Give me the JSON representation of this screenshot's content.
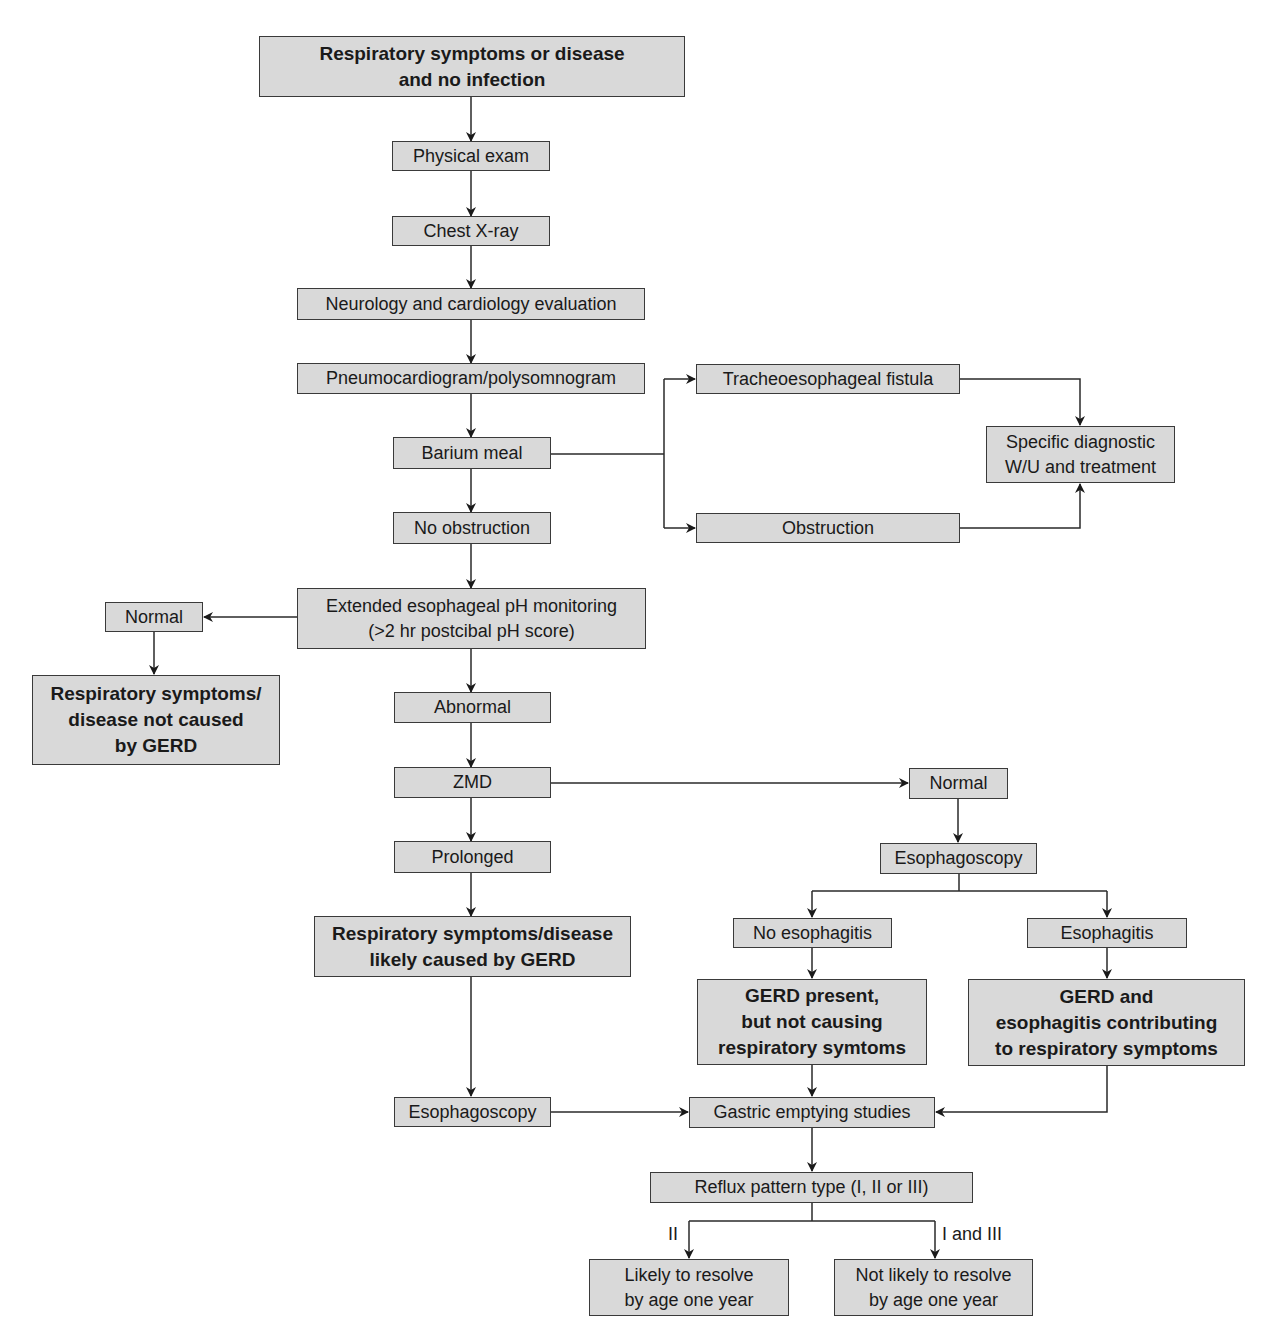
{
  "nodes": {
    "start": "Respiratory symptoms or disease\nand no infection",
    "physical_exam": "Physical exam",
    "chest_xray": "Chest X-ray",
    "neuro_cardio": "Neurology and cardiology evaluation",
    "pneumo": "Pneumocardiogram/polysomnogram",
    "barium": "Barium meal",
    "tef": "Tracheoesophageal fistula",
    "obstruction": "Obstruction",
    "specific_wu": "Specific diagnostic\nW/U and treatment",
    "no_obstruction": "No obstruction",
    "ph_monitoring": "Extended esophageal pH monitoring\n(>2 hr postcibal pH score)",
    "normal_left": "Normal",
    "not_caused": "Respiratory symptoms/\ndisease not caused\nby GERD",
    "abnormal": "Abnormal",
    "zmd": "ZMD",
    "normal_right": "Normal",
    "prolonged": "Prolonged",
    "esophagoscopy_right": "Esophagoscopy",
    "likely_caused": "Respiratory symptoms/disease\nlikely caused by GERD",
    "no_esophagitis": "No esophagitis",
    "esophagitis": "Esophagitis",
    "gerd_present": "GERD present,\nbut not causing\nrespiratory symtoms",
    "gerd_esophagitis": "GERD and\nesophagitis contributing\nto respiratory symptoms",
    "esophagoscopy_left": "Esophagoscopy",
    "gastric_emptying": "Gastric emptying studies",
    "reflux_pattern": "Reflux pattern type (I, II or III)",
    "likely_resolve": "Likely to resolve\nby age one year",
    "not_likely_resolve": "Not likely to resolve\nby age one year"
  },
  "edge_labels": {
    "type_ii": "II",
    "type_i_iii": "I and III"
  },
  "colors": {
    "box_fill": "#d9d9d9",
    "box_border": "#3a3a3a",
    "line": "#2a2a2a"
  }
}
